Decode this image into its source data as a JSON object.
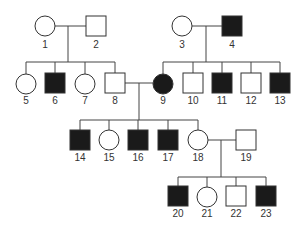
{
  "diagram": {
    "type": "pedigree",
    "colors": {
      "affected": "#1a1a1a",
      "unaffected": "#ffffff",
      "line": "#444444"
    },
    "individuals": [
      {
        "id": "1",
        "label": "1",
        "sex": "female",
        "affected": false
      },
      {
        "id": "2",
        "label": "2",
        "sex": "male",
        "affected": false
      },
      {
        "id": "3",
        "label": "3",
        "sex": "female",
        "affected": false
      },
      {
        "id": "4",
        "label": "4",
        "sex": "male",
        "affected": true
      },
      {
        "id": "5",
        "label": "5",
        "sex": "female",
        "affected": false
      },
      {
        "id": "6",
        "label": "6",
        "sex": "male",
        "affected": true
      },
      {
        "id": "7",
        "label": "7",
        "sex": "female",
        "affected": false
      },
      {
        "id": "8",
        "label": "8",
        "sex": "male",
        "affected": false
      },
      {
        "id": "9",
        "label": "9",
        "sex": "female",
        "affected": true
      },
      {
        "id": "10",
        "label": "10",
        "sex": "male",
        "affected": false
      },
      {
        "id": "11",
        "label": "11",
        "sex": "male",
        "affected": true
      },
      {
        "id": "12",
        "label": "12",
        "sex": "male",
        "affected": false
      },
      {
        "id": "13",
        "label": "13",
        "sex": "male",
        "affected": true
      },
      {
        "id": "14",
        "label": "14",
        "sex": "male",
        "affected": true
      },
      {
        "id": "15",
        "label": "15",
        "sex": "female",
        "affected": false
      },
      {
        "id": "16",
        "label": "16",
        "sex": "male",
        "affected": true
      },
      {
        "id": "17",
        "label": "17",
        "sex": "male",
        "affected": true
      },
      {
        "id": "18",
        "label": "18",
        "sex": "female",
        "affected": false
      },
      {
        "id": "19",
        "label": "19",
        "sex": "male",
        "affected": false
      },
      {
        "id": "20",
        "label": "20",
        "sex": "male",
        "affected": true
      },
      {
        "id": "21",
        "label": "21",
        "sex": "female",
        "affected": false
      },
      {
        "id": "22",
        "label": "22",
        "sex": "male",
        "affected": false
      },
      {
        "id": "23",
        "label": "23",
        "sex": "male",
        "affected": true
      }
    ],
    "matings": [
      {
        "parents": [
          "1",
          "2"
        ],
        "children": [
          "5",
          "6",
          "7",
          "8"
        ]
      },
      {
        "parents": [
          "3",
          "4"
        ],
        "children": [
          "9",
          "10",
          "11",
          "12",
          "13"
        ]
      },
      {
        "parents": [
          "8",
          "9"
        ],
        "children": [
          "14",
          "15",
          "16",
          "17",
          "18"
        ]
      },
      {
        "parents": [
          "18",
          "19"
        ],
        "children": [
          "20",
          "21",
          "22",
          "23"
        ]
      }
    ]
  }
}
